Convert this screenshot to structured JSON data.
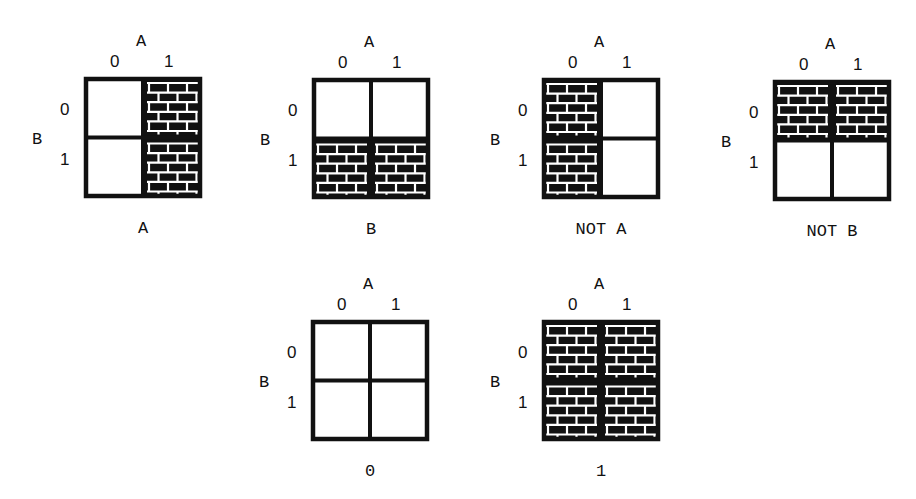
{
  "figure": {
    "column_variable": "A",
    "row_variable": "B",
    "column_values": [
      "0",
      "1"
    ],
    "row_values": [
      "0",
      "1"
    ],
    "fill_style": "brick",
    "colors": {
      "fill": "#111111",
      "mortar": "#ffffff",
      "border": "#111111",
      "background": "#ffffff"
    }
  },
  "diagrams": [
    {
      "caption": "A",
      "cells": {
        "b0a0": false,
        "b0a1": true,
        "b1a0": false,
        "b1a1": true
      }
    },
    {
      "caption": "B",
      "cells": {
        "b0a0": false,
        "b0a1": false,
        "b1a0": true,
        "b1a1": true
      }
    },
    {
      "caption": "NOT A",
      "cells": {
        "b0a0": true,
        "b0a1": false,
        "b1a0": true,
        "b1a1": false
      }
    },
    {
      "caption": "NOT B",
      "cells": {
        "b0a0": true,
        "b0a1": true,
        "b1a0": false,
        "b1a1": false
      }
    },
    {
      "caption": "0",
      "cells": {
        "b0a0": false,
        "b0a1": false,
        "b1a0": false,
        "b1a1": false
      }
    },
    {
      "caption": "1",
      "cells": {
        "b0a0": true,
        "b0a1": true,
        "b1a0": true,
        "b1a1": true
      }
    }
  ]
}
